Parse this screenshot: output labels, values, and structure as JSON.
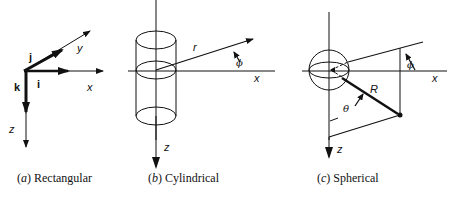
{
  "figure": {
    "panels": [
      {
        "id": "a",
        "caption_letter": "a",
        "caption_text": "Rectangular",
        "axis_labels": {
          "x": "x",
          "y": "y",
          "z": "z"
        },
        "unit_vectors": {
          "i": "i",
          "j": "j",
          "k": "k"
        }
      },
      {
        "id": "b",
        "caption_letter": "b",
        "caption_text": "Cylindrical",
        "axis_labels": {
          "x": "x",
          "z": "z"
        },
        "coords": {
          "r": "r",
          "phi": "ϕ"
        }
      },
      {
        "id": "c",
        "caption_letter": "c",
        "caption_text": "Spherical",
        "axis_labels": {
          "x": "x",
          "z": "z"
        },
        "coords": {
          "R": "R",
          "theta": "θ",
          "phi": "ϕ"
        }
      }
    ]
  }
}
